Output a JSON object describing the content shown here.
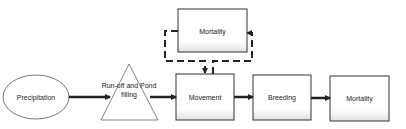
{
  "diagram": {
    "type": "flowchart",
    "nodes": [
      {
        "id": "precipitation",
        "shape": "ellipse",
        "label": "Precipitation"
      },
      {
        "id": "runoff",
        "shape": "triangle",
        "label_line1": "Run-off and Pond",
        "label_line2": "filling"
      },
      {
        "id": "movement",
        "shape": "rect",
        "label": "Movement"
      },
      {
        "id": "mortality_loop",
        "shape": "rect",
        "label": "Mortality"
      },
      {
        "id": "breeding",
        "shape": "rect",
        "label": "Breeding"
      },
      {
        "id": "mortality_end",
        "shape": "rect",
        "label": "Mortality"
      }
    ],
    "edges": [
      {
        "from": "precipitation",
        "to": "runoff",
        "style": "solid"
      },
      {
        "from": "runoff",
        "to": "movement",
        "style": "solid"
      },
      {
        "from": "movement",
        "to": "breeding",
        "style": "solid"
      },
      {
        "from": "breeding",
        "to": "mortality_end",
        "style": "solid"
      },
      {
        "from": "movement",
        "to": "mortality_loop",
        "style": "dashed"
      },
      {
        "from": "mortality_loop",
        "to": "movement",
        "style": "dashed"
      }
    ],
    "colors": {
      "stroke": "#222222",
      "fill": "#ffffff",
      "shade": "#e6e6e6"
    }
  }
}
